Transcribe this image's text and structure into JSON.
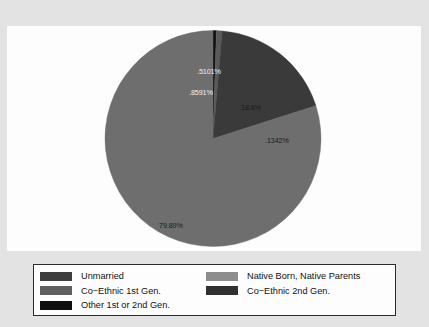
{
  "chart_data": {
    "type": "pie",
    "title": "",
    "subtitle": "",
    "xlabel": "",
    "ylabel": "",
    "grid": false,
    "legend_position": "bottom",
    "start_angle_deg": 0,
    "direction": "clockwise",
    "categories": [
      "Other 1st or 2nd Gen.",
      "Co-Ethnic 1st Gen.",
      "Co-Ethnic 2nd Gen.",
      "Unmarried",
      "Native Born, Native Parents"
    ],
    "values": [
      0.5101,
      0.8591,
      18.6,
      0.1342,
      79.89
    ],
    "labels": [
      ".5101%",
      ".8591%",
      "18.6%",
      ".1342%",
      "79.89%"
    ],
    "colors": [
      "#121212",
      "#5a5a5a",
      "#3a3a3a",
      "#2e2e2e",
      "#6e6e6e"
    ]
  },
  "pie": {
    "slices": [
      {
        "name": "other-1st-or-2nd-gen",
        "label": ".5101%",
        "value": 0.5101,
        "color": "#121212"
      },
      {
        "name": "co-ethnic-1st-gen",
        "label": ".8591%",
        "value": 0.8591,
        "color": "#5a5a5a"
      },
      {
        "name": "co-ethnic-2nd-gen",
        "label": "18.6%",
        "value": 18.6,
        "color": "#3a3a3a"
      },
      {
        "name": "unmarried",
        "label": ".1342%",
        "value": 0.1342,
        "color": "#2e2e2e"
      },
      {
        "name": "native-born",
        "label": "79.89%",
        "value": 79.89,
        "color": "#6e6e6e"
      }
    ]
  },
  "legend": {
    "entries": [
      {
        "label": "Unmarried",
        "color": "#3d3d3d"
      },
      {
        "label": "Native Born, Native Parents",
        "color": "#8d8d8d"
      },
      {
        "label": "Co−Ethnic 1st Gen.",
        "color": "#5f5f5f"
      },
      {
        "label": "Co−Ethnic 2nd Gen.",
        "color": "#303030"
      },
      {
        "label": "Other 1st or 2nd Gen.",
        "color": "#0e0e0e"
      }
    ]
  },
  "theme": {
    "background": "#e3e3e3",
    "panel": "#fdfdfd",
    "legend_border": "#2b2b2b",
    "label_light": "#f2f2f2",
    "label_dark": "#1a1a1a"
  }
}
